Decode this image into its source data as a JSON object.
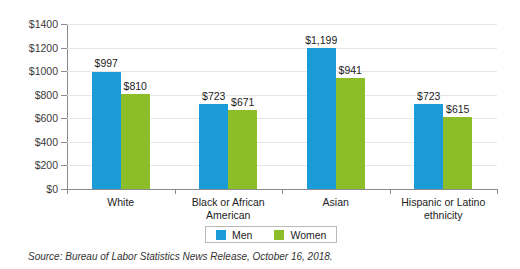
{
  "chart_data": {
    "type": "bar",
    "title": "",
    "subtitle": "",
    "xlabel": "",
    "ylabel": "",
    "ylim": [
      0,
      1400
    ],
    "ytick_values": [
      0,
      200,
      400,
      600,
      800,
      1000,
      1200,
      1400
    ],
    "ytick_labels": [
      "$0",
      "$200",
      "$400",
      "$600",
      "$800",
      "$1000",
      "$1200",
      "$1400"
    ],
    "grid": true,
    "legend_position": "bottom-center",
    "categories": [
      "White",
      "Black or African American",
      "Asian",
      "Hispanic or Latino ethnicity"
    ],
    "category_lines": [
      [
        "White"
      ],
      [
        "Black or African",
        "American"
      ],
      [
        "Asian"
      ],
      [
        "Hispanic or Latino",
        "ethnicity"
      ]
    ],
    "series": [
      {
        "name": "Men",
        "color": "#1b9bd7",
        "values": [
          997,
          723,
          1199,
          723
        ],
        "labels": [
          "$997",
          "$723",
          "$1,199",
          "$723"
        ]
      },
      {
        "name": "Women",
        "color": "#8cbe29",
        "values": [
          810,
          671,
          941,
          615
        ],
        "labels": [
          "$810",
          "$671",
          "$941",
          "$615"
        ]
      }
    ],
    "annotations": []
  },
  "legend": {
    "items": [
      {
        "label": "Men",
        "color": "#1b9bd7"
      },
      {
        "label": "Women",
        "color": "#8cbe29"
      }
    ]
  },
  "source": {
    "text": "Source: Bureau of Labor Statistics News Release, October 16, 2018."
  },
  "colors": {
    "men": "#1b9bd7",
    "women": "#8cbe29",
    "gridline": "#e6e6e6",
    "axis": "#8a8a8a",
    "text": "#222222",
    "background": "#ffffff"
  }
}
